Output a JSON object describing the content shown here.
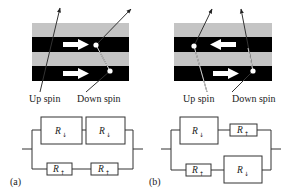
{
  "panels": [
    {
      "id": "a",
      "label": "(a)",
      "top_layer_arrow": "right",
      "bottom_layer_arrow": "right",
      "spin_labels": [
        "Up spin",
        "Down spin"
      ],
      "circuit": {
        "upper_branch": [
          {
            "label": "R",
            "subscript": "↓",
            "size": "large"
          },
          {
            "label": "R",
            "subscript": "↓",
            "size": "large"
          }
        ],
        "lower_branch": [
          {
            "label": "R",
            "subscript": "↑",
            "size": "small"
          },
          {
            "label": "R",
            "subscript": "↑",
            "size": "small"
          }
        ]
      }
    },
    {
      "id": "b",
      "label": "(b)",
      "top_layer_arrow": "left",
      "bottom_layer_arrow": "right",
      "spin_labels": [
        "Up spin",
        "Down spin"
      ],
      "circuit": {
        "upper_branch": [
          {
            "label": "R",
            "subscript": "↓",
            "size": "large"
          },
          {
            "label": "R",
            "subscript": "↑",
            "size": "small"
          }
        ],
        "lower_branch": [
          {
            "label": "R",
            "subscript": "↑",
            "size": "small"
          },
          {
            "label": "R",
            "subscript": "↓",
            "size": "large"
          }
        ]
      }
    }
  ],
  "colors": {
    "nonmagnetic_layer": "#c4c4c4",
    "magnetic_layer": "#000000",
    "magnetization_arrow": "#ffffff",
    "electron_path": "#222222"
  }
}
